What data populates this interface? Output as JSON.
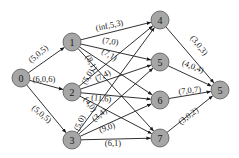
{
  "diagram": {
    "type": "flow-network",
    "node_fill": "#a6a6a6",
    "node_stroke": "#555555",
    "edge_color": "#1a1a1a",
    "nodes": [
      {
        "id": "s",
        "label": "0",
        "x": 21,
        "y": 78
      },
      {
        "id": "n1",
        "label": "1",
        "x": 72,
        "y": 42
      },
      {
        "id": "n2",
        "label": "2",
        "x": 72,
        "y": 92
      },
      {
        "id": "n3",
        "label": "3",
        "x": 72,
        "y": 140
      },
      {
        "id": "m4",
        "label": "4",
        "x": 160,
        "y": 20
      },
      {
        "id": "m5",
        "label": "5",
        "x": 160,
        "y": 62
      },
      {
        "id": "m6",
        "label": "6",
        "x": 160,
        "y": 100
      },
      {
        "id": "m7",
        "label": "7",
        "x": 160,
        "y": 138
      },
      {
        "id": "t",
        "label": "5",
        "x": 220,
        "y": 90
      }
    ],
    "edges": [
      {
        "from": "s",
        "to": "n1",
        "label": "(5,0,5)",
        "lx": 40,
        "ly": 56,
        "rot": -40
      },
      {
        "from": "s",
        "to": "n2",
        "label": "(6,0,6)",
        "lx": 44,
        "ly": 82,
        "rot": 0
      },
      {
        "from": "s",
        "to": "n3",
        "label": "(5,0,5)",
        "lx": 40,
        "ly": 116,
        "rot": 40
      },
      {
        "from": "n1",
        "to": "m4",
        "label": "(inf,5,3)",
        "lx": 110,
        "ly": 28,
        "rot": -12
      },
      {
        "from": "n1",
        "to": "m5",
        "label": "(7,0)",
        "lx": 110,
        "ly": 44,
        "rot": 8
      },
      {
        "from": "n1",
        "to": "m6",
        "label": "(7,1)",
        "lx": 108,
        "ly": 57,
        "rot": 30
      },
      {
        "from": "n1",
        "to": "m7",
        "label": "(8,1)",
        "lx": 89,
        "ly": 64,
        "rot": 62
      },
      {
        "from": "n2",
        "to": "m4",
        "label": "(5,0)",
        "lx": 90,
        "ly": 78,
        "rot": -58
      },
      {
        "from": "n2",
        "to": "m5",
        "label": "(7,4)",
        "lx": 104,
        "ly": 78,
        "rot": -28
      },
      {
        "from": "n2",
        "to": "m6",
        "label": "(11,6)",
        "lx": 101,
        "ly": 101,
        "rot": 5
      },
      {
        "from": "n2",
        "to": "m7",
        "label": "(4,0)",
        "lx": 88,
        "ly": 106,
        "rot": 55
      },
      {
        "from": "n3",
        "to": "m4",
        "label": "(5,0)",
        "lx": 82,
        "ly": 124,
        "rot": -64
      },
      {
        "from": "n3",
        "to": "m5",
        "label": "(3,4)",
        "lx": 101,
        "ly": 117,
        "rot": -38
      },
      {
        "from": "n3",
        "to": "m6",
        "label": "(9,0)",
        "lx": 108,
        "ly": 130,
        "rot": -20
      },
      {
        "from": "n3",
        "to": "m7",
        "label": "(6,1)",
        "lx": 113,
        "ly": 146,
        "rot": 0
      },
      {
        "from": "m4",
        "to": "t",
        "label": "(3,0,3)",
        "lx": 197,
        "ly": 47,
        "rot": 52
      },
      {
        "from": "m5",
        "to": "t",
        "label": "(4,0,4)",
        "lx": 192,
        "ly": 69,
        "rot": 22
      },
      {
        "from": "m6",
        "to": "t",
        "label": "(7,0,7)",
        "lx": 190,
        "ly": 93,
        "rot": -6
      },
      {
        "from": "m7",
        "to": "t",
        "label": "(3,0,2)",
        "lx": 190,
        "ly": 118,
        "rot": -38
      }
    ]
  }
}
